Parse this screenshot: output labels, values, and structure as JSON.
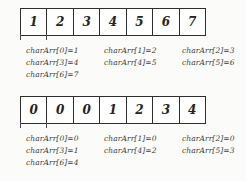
{
  "document": {
    "title": "Array index/value diagram",
    "background_color": "#fbfbf9",
    "ink_color": "#2e2e2e",
    "text_color": "#3c3c3c"
  },
  "blocks": [
    {
      "name": "array-block-top",
      "cells": [
        "1",
        "2",
        "3",
        "4",
        "5",
        "6",
        "7"
      ],
      "annotation_rows": [
        [
          "charArr[0]=1",
          "charArr[1]=2",
          "charArr[2]=3"
        ],
        [
          "charArr[3]=4",
          "charArr[4]=5",
          "charArr[5]=6"
        ],
        [
          "charArr[6]=7",
          "",
          ""
        ]
      ]
    },
    {
      "name": "array-block-bottom",
      "cells": [
        "0",
        "0",
        "0",
        "1",
        "2",
        "3",
        "4"
      ],
      "annotation_rows": [
        [
          "charArr[0]=0",
          "charArr[1]=0",
          "charArr[2]=0"
        ],
        [
          "charArr[3]=1",
          "charArr[4]=2",
          "charArr[5]=3"
        ],
        [
          "charArr[6]=4",
          "",
          ""
        ]
      ]
    }
  ]
}
